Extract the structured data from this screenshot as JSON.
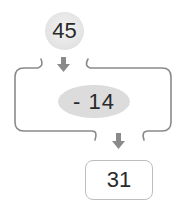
{
  "diagram": {
    "start_value": "45",
    "operation": "- 14",
    "result_value": "31",
    "arrow_color": "#8a8a8a",
    "line_color": "#8a8a8a",
    "icons": [
      "arrow-down-icon",
      "arrow-down-icon"
    ]
  }
}
